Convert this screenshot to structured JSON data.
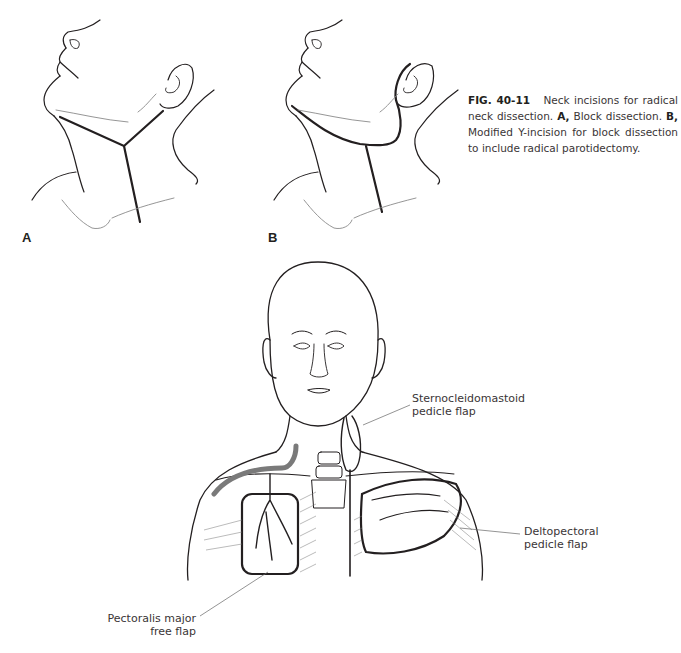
{
  "figure": {
    "panel_labels": {
      "a": "A",
      "b": "B"
    },
    "caption": {
      "figure_number": "FIG. 40-11",
      "text_1": "Neck incisions for radical neck dissection.",
      "label_a": "A,",
      "text_a": "Block dissection.",
      "label_b": "B,",
      "text_b": "Modified Y-incision for block dissection to include radical parotidectomy."
    },
    "annotations": {
      "scm_line1": "Sternocleidomastoid",
      "scm_line2": "pedicle flap",
      "delto_line1": "Deltopectoral",
      "delto_line2": "pedicle flap",
      "pect_line1": "Pectoralis major",
      "pect_line2": "free flap"
    },
    "colors": {
      "ink": "#231f20",
      "light_line": "#8a8a8a",
      "vessel": "#7a7a7a"
    }
  }
}
